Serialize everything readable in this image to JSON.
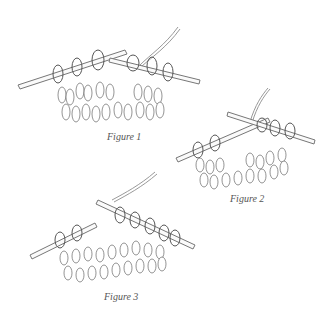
{
  "figures": [
    {
      "id": "figure-1",
      "caption": "Figure 1"
    },
    {
      "id": "figure-2",
      "caption": "Figure 2"
    },
    {
      "id": "figure-3",
      "caption": "Figure 3"
    }
  ]
}
